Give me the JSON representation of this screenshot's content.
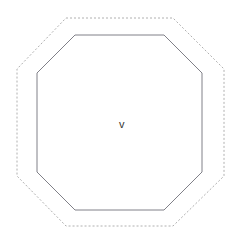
{
  "canvas": {
    "width": 244,
    "height": 244,
    "background_color": "#ffffff",
    "name": "octagon-shape-view"
  },
  "labels": {
    "center": "v"
  },
  "colors": {
    "background": "#ffffff",
    "inner_stroke": "#808088",
    "outer_stroke": "#b0b0b0",
    "label_text": "#333333"
  },
  "shapes": {
    "inner_octagon": {
      "name": "inner-octagon",
      "style": "solid",
      "stroke_color": "#808088",
      "stroke_width": 1,
      "fill": "none",
      "points": "75,35 164,35 202,73 202,172 164,210 75,210 37,172 37,73"
    },
    "outer_octagon": {
      "name": "outer-octagon",
      "style": "dashed",
      "stroke_color": "#b0b0b0",
      "stroke_width": 1,
      "fill": "none",
      "dash_pattern": "2 2",
      "points": "66,18 173,18 224,69 224,176 173,226 66,226 17,176 17,69"
    }
  }
}
